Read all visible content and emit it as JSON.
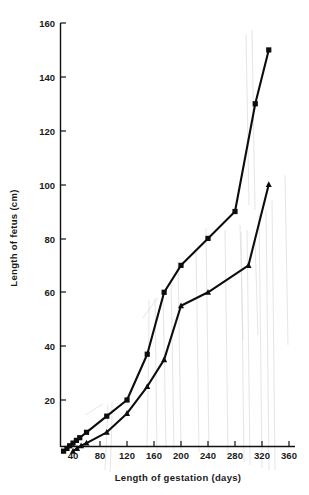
{
  "chart_data": {
    "type": "line",
    "title": "",
    "xlabel": "Length of gestation (days)",
    "ylabel": "Length of fetus (cm)",
    "xlim": [
      20,
      360
    ],
    "ylim": [
      0,
      160
    ],
    "xticks": [
      40,
      80,
      120,
      160,
      200,
      240,
      280,
      320,
      360
    ],
    "xtick_labels": [
      "40",
      "80",
      "120",
      "160",
      "200",
      "240",
      "280",
      "320",
      "360"
    ],
    "yticks": [
      20,
      40,
      60,
      80,
      100,
      120,
      140,
      160
    ],
    "ytick_labels": [
      "20",
      "40",
      "60",
      "80",
      "100",
      "120",
      "140",
      "160"
    ],
    "grid": false,
    "legend": "none",
    "series": [
      {
        "name": "square-series",
        "marker": "square",
        "points": [
          {
            "x": 26,
            "y": 1
          },
          {
            "x": 31,
            "y": 2
          },
          {
            "x": 35,
            "y": 3
          },
          {
            "x": 40,
            "y": 4
          },
          {
            "x": 45,
            "y": 5
          },
          {
            "x": 50,
            "y": 6
          },
          {
            "x": 60,
            "y": 8
          },
          {
            "x": 90,
            "y": 14
          },
          {
            "x": 120,
            "y": 20
          },
          {
            "x": 150,
            "y": 37
          },
          {
            "x": 175,
            "y": 60
          },
          {
            "x": 200,
            "y": 70
          },
          {
            "x": 240,
            "y": 80
          },
          {
            "x": 280,
            "y": 90
          },
          {
            "x": 310,
            "y": 130
          },
          {
            "x": 330,
            "y": 150
          }
        ]
      },
      {
        "name": "triangle-series",
        "marker": "triangle",
        "points": [
          {
            "x": 40,
            "y": 1
          },
          {
            "x": 46,
            "y": 2
          },
          {
            "x": 52,
            "y": 3
          },
          {
            "x": 60,
            "y": 4
          },
          {
            "x": 90,
            "y": 8
          },
          {
            "x": 120,
            "y": 15
          },
          {
            "x": 150,
            "y": 25
          },
          {
            "x": 175,
            "y": 35
          },
          {
            "x": 200,
            "y": 55
          },
          {
            "x": 240,
            "y": 60
          },
          {
            "x": 300,
            "y": 70
          },
          {
            "x": 330,
            "y": 100
          }
        ]
      }
    ]
  },
  "axes": {
    "x_title": "Length of gestation (days)",
    "y_title": "Length of fetus (cm)"
  }
}
